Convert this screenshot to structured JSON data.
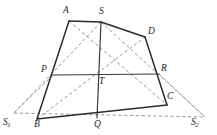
{
  "figure": {
    "background_color": "#ffffff",
    "solid_stroke_color": "#2b2b2b",
    "dashed_stroke_color": "#8a8a8a",
    "label_color": "#1d1d1d",
    "width": 217,
    "height": 135
  },
  "labels": {
    "A": "A",
    "S": "S",
    "D": "D",
    "P": "P",
    "T": "T",
    "R": "R",
    "B": "B",
    "Q": "Q",
    "C": "C",
    "S1_main": "S",
    "S1_sub": "1",
    "S2_main": "S",
    "S2_sub": "2"
  },
  "points": {
    "A": {
      "x": 69,
      "y": 21
    },
    "S": {
      "x": 101,
      "y": 22
    },
    "D": {
      "x": 145,
      "y": 37
    },
    "P": {
      "x": 53,
      "y": 75
    },
    "T": {
      "x": 97,
      "y": 76
    },
    "R": {
      "x": 159,
      "y": 74
    },
    "B": {
      "x": 37,
      "y": 119
    },
    "Q": {
      "x": 97,
      "y": 118
    },
    "C": {
      "x": 167,
      "y": 105
    },
    "S1": {
      "x": 14,
      "y": 113
    },
    "S2": {
      "x": 205,
      "y": 117
    }
  },
  "label_positions": {
    "A": {
      "x": 63,
      "y": 6
    },
    "S": {
      "x": 99,
      "y": 7
    },
    "D": {
      "x": 148,
      "y": 27
    },
    "P": {
      "x": 41,
      "y": 65
    },
    "T": {
      "x": 99,
      "y": 77
    },
    "R": {
      "x": 161,
      "y": 64
    },
    "B": {
      "x": 34,
      "y": 120
    },
    "Q": {
      "x": 94,
      "y": 120
    },
    "C": {
      "x": 167,
      "y": 92
    },
    "S1": {
      "x": 3,
      "y": 118
    },
    "S2": {
      "x": 191,
      "y": 118
    }
  },
  "solid_segments": [
    {
      "name": "segment-A-S",
      "from": "A",
      "to": "S"
    },
    {
      "name": "segment-S-D",
      "from": "S",
      "to": "D"
    },
    {
      "name": "segment-D-C",
      "from": "D",
      "to": "C"
    },
    {
      "name": "segment-C-B",
      "from": "C",
      "to": "B"
    },
    {
      "name": "segment-B-A",
      "from": "B",
      "to": "A"
    },
    {
      "name": "segment-P-R",
      "from": "P",
      "to": "R"
    },
    {
      "name": "segment-S-Q",
      "from": "S",
      "to": "Q"
    }
  ],
  "dashed_segments": [
    {
      "name": "diagonal-A-C",
      "from": "A",
      "to": "C"
    },
    {
      "name": "diagonal-B-D",
      "from": "B",
      "to": "D"
    },
    {
      "name": "ray-S-to-S1",
      "from": "S",
      "to": "S1"
    },
    {
      "name": "ray-S-to-S2",
      "from": "S",
      "to": "S2"
    },
    {
      "name": "baseline-S1-S2",
      "from": "S1",
      "to": "S2"
    },
    {
      "name": "ray-P-to-S1",
      "from": "P",
      "to": "S1"
    },
    {
      "name": "ray-R-to-S2",
      "from": "R",
      "to": "S2"
    }
  ]
}
